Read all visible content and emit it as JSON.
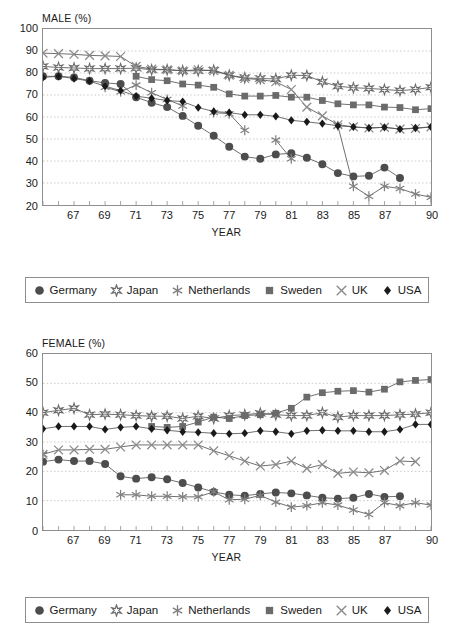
{
  "charts": [
    {
      "id": "male",
      "axis_title": "MALE (%)",
      "xlabel": "YEAR",
      "ylim": [
        20,
        100
      ],
      "yticks": [
        100,
        90,
        80,
        70,
        60,
        50,
        40,
        30,
        20
      ],
      "xlim": [
        1965,
        1990
      ],
      "xticks": [
        {
          "value": 1967,
          "label": "67"
        },
        {
          "value": 1969,
          "label": "69"
        },
        {
          "value": 1971,
          "label": "71"
        },
        {
          "value": 1973,
          "label": "73"
        },
        {
          "value": 1975,
          "label": "75"
        },
        {
          "value": 1977,
          "label": "77"
        },
        {
          "value": 1979,
          "label": "79"
        },
        {
          "value": 1981,
          "label": "81"
        },
        {
          "value": 1983,
          "label": "83"
        },
        {
          "value": 1985,
          "label": "85"
        },
        {
          "value": 1987,
          "label": "87"
        },
        {
          "value": 1990,
          "label": "90"
        }
      ]
    },
    {
      "id": "female",
      "axis_title": "FEMALE (%)",
      "xlabel": "YEAR",
      "ylim": [
        0,
        60
      ],
      "yticks": [
        60,
        50,
        40,
        30,
        20,
        10,
        0
      ],
      "xlim": [
        1965,
        1990
      ],
      "xticks": [
        {
          "value": 1967,
          "label": "67"
        },
        {
          "value": 1969,
          "label": "69"
        },
        {
          "value": 1971,
          "label": "71"
        },
        {
          "value": 1973,
          "label": "73"
        },
        {
          "value": 1975,
          "label": "75"
        },
        {
          "value": 1977,
          "label": "77"
        },
        {
          "value": 1979,
          "label": "79"
        },
        {
          "value": 1981,
          "label": "81"
        },
        {
          "value": 1983,
          "label": "83"
        },
        {
          "value": 1985,
          "label": "85"
        },
        {
          "value": 1987,
          "label": "87"
        },
        {
          "value": 1990,
          "label": "90"
        }
      ]
    }
  ],
  "legend": {
    "items": [
      {
        "label": "Germany",
        "marker": "circle",
        "color": "#4d4d4d"
      },
      {
        "label": "Japan",
        "marker": "star6",
        "color": "#6b6b6b"
      },
      {
        "label": "Netherlands",
        "marker": "asterisk",
        "color": "#808080"
      },
      {
        "label": "Sweden",
        "marker": "square",
        "color": "#6b6b6b"
      },
      {
        "label": "UK",
        "marker": "xcross",
        "color": "#8a8a8a"
      },
      {
        "label": "USA",
        "marker": "diamond",
        "color": "#1a1a1a"
      }
    ]
  },
  "chart_data": [
    {
      "type": "line",
      "id": "male",
      "title": "MALE (%)",
      "xlabel": "YEAR",
      "ylabel": "MALE (%)",
      "ylim": [
        20,
        100
      ],
      "xlim": [
        1965,
        1990
      ],
      "grid": true,
      "legend_position": "below",
      "x": [
        1965,
        1966,
        1967,
        1968,
        1969,
        1970,
        1971,
        1972,
        1973,
        1974,
        1975,
        1976,
        1977,
        1978,
        1979,
        1980,
        1981,
        1982,
        1983,
        1984,
        1985,
        1986,
        1987,
        1988,
        1989,
        1990
      ],
      "series": [
        {
          "name": "Germany",
          "marker": "circle",
          "values": [
            78.5,
            78.5,
            78.0,
            76.5,
            75.5,
            75.0,
            69.0,
            66.5,
            64.5,
            60.5,
            56.0,
            51.5,
            46.5,
            42.0,
            41.0,
            43.0,
            43.5,
            41.5,
            38.5,
            34.5,
            33.0,
            33.3,
            37.0,
            32.3,
            null,
            null
          ]
        },
        {
          "name": "Japan",
          "marker": "star6",
          "values": [
            83.0,
            82.5,
            82.3,
            82.0,
            82.0,
            82.0,
            82.2,
            81.5,
            81.5,
            81.0,
            81.0,
            81.3,
            79.0,
            77.8,
            77.5,
            77.3,
            79.0,
            78.8,
            76.0,
            74.0,
            73.3,
            73.0,
            72.5,
            72.0,
            72.5,
            73.5
          ]
        },
        {
          "name": "Netherlands",
          "marker": "asterisk",
          "values": [
            null,
            null,
            null,
            null,
            73.5,
            71.5,
            74.5,
            71.0,
            68.0,
            65.0,
            null,
            62.0,
            61.5,
            54.0,
            null,
            49.5,
            41.0,
            null,
            null,
            56.0,
            28.5,
            24.0,
            28.5,
            27.5,
            25.0,
            23.5
          ]
        },
        {
          "name": "Sweden",
          "marker": "square",
          "values": [
            null,
            null,
            null,
            null,
            null,
            null,
            78.5,
            77.0,
            76.5,
            75.0,
            74.5,
            73.5,
            70.5,
            69.5,
            69.5,
            69.8,
            69.0,
            69.0,
            67.5,
            66.0,
            65.5,
            65.5,
            64.5,
            64.3,
            63.3,
            63.8
          ]
        },
        {
          "name": "UK",
          "marker": "xcross",
          "values": [
            89.0,
            88.8,
            88.5,
            88.0,
            87.8,
            87.5,
            83.0,
            81.8,
            81.5,
            81.0,
            81.5,
            81.0,
            79.0,
            77.5,
            77.0,
            76.0,
            72.5,
            64.5,
            60.5,
            56.5,
            55.5,
            55.0,
            55.3,
            54.5,
            54.8,
            55.5
          ]
        },
        {
          "name": "USA",
          "marker": "diamond",
          "values": [
            78.0,
            78.5,
            77.5,
            76.3,
            74.0,
            72.0,
            69.5,
            68.5,
            67.5,
            67.0,
            64.3,
            62.5,
            62.0,
            61.0,
            61.0,
            60.3,
            58.5,
            57.8,
            57.0,
            56.0,
            55.5,
            55.0,
            55.3,
            54.5,
            55.0,
            55.5
          ]
        }
      ]
    },
    {
      "type": "line",
      "id": "female",
      "title": "FEMALE (%)",
      "xlabel": "YEAR",
      "ylabel": "FEMALE (%)",
      "ylim": [
        0,
        60
      ],
      "xlim": [
        1965,
        1990
      ],
      "grid": true,
      "legend_position": "below",
      "x": [
        1965,
        1966,
        1967,
        1968,
        1969,
        1970,
        1971,
        1972,
        1973,
        1974,
        1975,
        1976,
        1977,
        1978,
        1979,
        1980,
        1981,
        1982,
        1983,
        1984,
        1985,
        1986,
        1987,
        1988,
        1989,
        1990
      ],
      "series": [
        {
          "name": "Germany",
          "marker": "circle",
          "values": [
            23.3,
            24.0,
            23.5,
            23.5,
            22.5,
            18.3,
            17.5,
            18.0,
            17.3,
            16.0,
            14.5,
            13.0,
            12.0,
            11.7,
            12.3,
            12.8,
            12.5,
            11.8,
            11.0,
            10.7,
            11.0,
            12.3,
            11.3,
            11.5,
            null,
            null
          ]
        },
        {
          "name": "Japan",
          "marker": "star6",
          "values": [
            40.0,
            40.8,
            41.5,
            39.3,
            39.5,
            39.3,
            39.0,
            38.8,
            38.8,
            38.0,
            38.8,
            38.0,
            39.0,
            39.3,
            39.8,
            39.3,
            39.0,
            39.0,
            40.0,
            38.5,
            39.0,
            39.0,
            39.0,
            39.3,
            39.5,
            40.0
          ]
        },
        {
          "name": "Netherlands",
          "marker": "asterisk",
          "values": [
            25.8,
            null,
            null,
            null,
            null,
            12.0,
            12.0,
            11.5,
            11.5,
            11.3,
            11.3,
            13.0,
            10.3,
            10.5,
            11.8,
            9.5,
            7.8,
            8.3,
            9.3,
            8.5,
            6.8,
            5.3,
            9.3,
            8.3,
            9.3,
            8.5
          ]
        },
        {
          "name": "Sweden",
          "marker": "square",
          "values": [
            null,
            null,
            null,
            null,
            null,
            null,
            null,
            35.3,
            35.0,
            35.3,
            36.8,
            38.5,
            38.0,
            39.0,
            39.3,
            39.8,
            41.5,
            45.3,
            46.8,
            47.3,
            47.5,
            47.0,
            48.0,
            50.5,
            51.0,
            51.3
          ]
        },
        {
          "name": "UK",
          "marker": "xcross",
          "values": [
            25.8,
            27.3,
            27.3,
            27.5,
            27.5,
            28.3,
            29.0,
            29.0,
            29.0,
            29.0,
            29.0,
            27.0,
            25.3,
            23.5,
            21.8,
            22.3,
            23.5,
            21.0,
            22.3,
            19.3,
            19.8,
            19.5,
            20.3,
            23.5,
            23.3,
            null
          ]
        },
        {
          "name": "USA",
          "marker": "diamond",
          "values": [
            34.5,
            35.3,
            35.3,
            35.3,
            34.3,
            35.0,
            35.3,
            34.5,
            34.0,
            33.5,
            33.3,
            33.0,
            32.8,
            33.0,
            33.8,
            33.5,
            32.8,
            33.8,
            34.0,
            33.8,
            33.8,
            33.5,
            33.5,
            34.3,
            36.0,
            36.0
          ]
        }
      ]
    }
  ]
}
